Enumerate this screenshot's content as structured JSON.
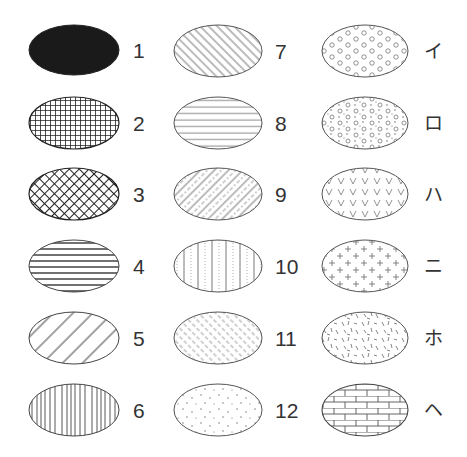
{
  "figure": {
    "columns": [
      {
        "items": [
          {
            "label": "1",
            "pattern": "solid-black"
          },
          {
            "label": "2",
            "pattern": "square-grid"
          },
          {
            "label": "3",
            "pattern": "diagonal-crosshatch"
          },
          {
            "label": "4",
            "pattern": "horizontal-lines-wide"
          },
          {
            "label": "5",
            "pattern": "diagonal-lines-wide-backslash"
          },
          {
            "label": "6",
            "pattern": "vertical-lines"
          }
        ]
      },
      {
        "items": [
          {
            "label": "7",
            "pattern": "diagonal-lines-dense-slash"
          },
          {
            "label": "8",
            "pattern": "horizontal-lines-thin"
          },
          {
            "label": "9",
            "pattern": "diagonal-lines-with-dashes"
          },
          {
            "label": "10",
            "pattern": "vertical-lines-with-dots"
          },
          {
            "label": "11",
            "pattern": "short-diagonal-dashes"
          },
          {
            "label": "12",
            "pattern": "sparse-dots"
          }
        ]
      },
      {
        "items": [
          {
            "label": "イ",
            "pattern": "small-circles"
          },
          {
            "label": "ロ",
            "pattern": "circles-and-dots"
          },
          {
            "label": "ハ",
            "pattern": "v-marks"
          },
          {
            "label": "ニ",
            "pattern": "plus-marks"
          },
          {
            "label": "ホ",
            "pattern": "random-short-strokes"
          },
          {
            "label": "ヘ",
            "pattern": "brick"
          }
        ]
      }
    ],
    "colors": {
      "outline": "#555555",
      "ink": "#222222",
      "label": "#333333",
      "background": "#ffffff"
    }
  }
}
